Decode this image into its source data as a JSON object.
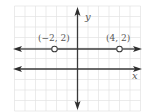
{
  "figure": {
    "type": "coordinate-plane-graph",
    "axes": {
      "x_label": "x",
      "y_label": "y"
    },
    "grid": {
      "x_min": -6,
      "x_max": 6,
      "y_min": -4,
      "y_max": 6,
      "unit_px": 10.5
    },
    "lines": [
      {
        "name": "horizontal-line-y2",
        "y": 2,
        "arrows": "both",
        "open_points": [
          [
            -2,
            2
          ],
          [
            4,
            2
          ]
        ]
      }
    ],
    "points": [
      {
        "label": "(−2, 2)",
        "x": -2,
        "y": 2,
        "style": "open"
      },
      {
        "label": "(4, 2)",
        "x": 4,
        "y": 2,
        "style": "open"
      }
    ],
    "colors": {
      "line": "#3a3a3a",
      "grid": "#e2e2e2",
      "text": "#555555"
    }
  }
}
